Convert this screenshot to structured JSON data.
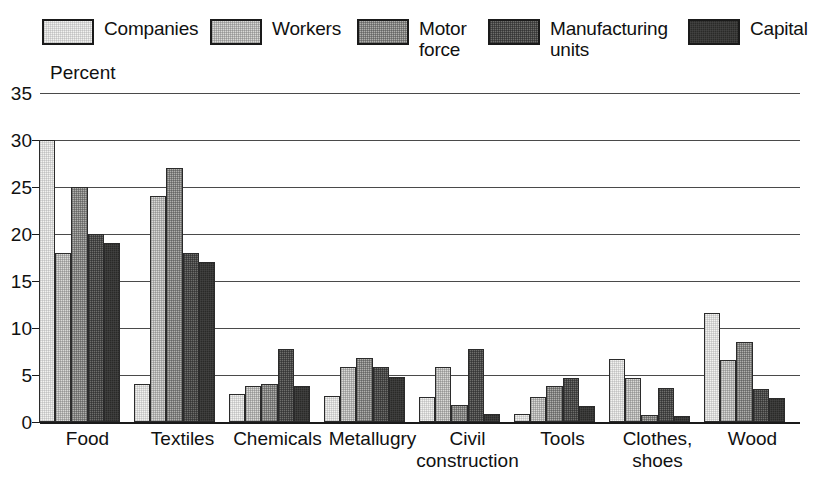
{
  "chart_data": {
    "type": "bar",
    "title": "",
    "ylabel": "Percent",
    "xlabel": "",
    "ylim": [
      0,
      35
    ],
    "yticks": [
      0,
      5,
      10,
      15,
      20,
      25,
      30,
      35
    ],
    "grid": true,
    "legend_position": "top",
    "categories": [
      "Food",
      "Textiles",
      "Chemicals",
      "Metallugry",
      "Civil\nconstruction",
      "Tools",
      "Clothes,\nshoes",
      "Wood"
    ],
    "series": [
      {
        "name": "Companies",
        "color": "#f2f2f0",
        "values": [
          30.0,
          4.0,
          3.0,
          2.8,
          2.7,
          0.8,
          6.7,
          11.6
        ]
      },
      {
        "name": "Workers",
        "color": "#d9d9d6",
        "values": [
          18.0,
          24.0,
          3.8,
          5.8,
          5.8,
          2.7,
          4.7,
          6.6
        ]
      },
      {
        "name": "Motor force",
        "color": "#b0b0ad",
        "values": [
          25.0,
          27.0,
          4.0,
          6.8,
          1.8,
          3.8,
          0.7,
          8.5
        ]
      },
      {
        "name": "Manufacturing units",
        "color": "#6e6e6c",
        "values": [
          20.0,
          18.0,
          7.8,
          5.8,
          7.8,
          4.7,
          3.6,
          3.5
        ]
      },
      {
        "name": "Capital",
        "color": "#2a2a28",
        "values": [
          19.0,
          17.0,
          3.8,
          4.8,
          0.8,
          1.7,
          0.6,
          2.6
        ]
      }
    ]
  },
  "legend": {
    "items": [
      {
        "label": "Companies",
        "swatch": "swatch-companies"
      },
      {
        "label": "Workers",
        "swatch": "swatch-workers"
      },
      {
        "label": "Motor\nforce",
        "swatch": "swatch-motor-force"
      },
      {
        "label": "Manufacturing\nunits",
        "swatch": "swatch-manufacturing-units"
      },
      {
        "label": "Capital",
        "swatch": "swatch-capital"
      }
    ]
  },
  "axis": {
    "y_unit_label": "Percent",
    "y_tick_labels": [
      "0",
      "5",
      "10",
      "15",
      "20",
      "25",
      "30",
      "35"
    ]
  }
}
